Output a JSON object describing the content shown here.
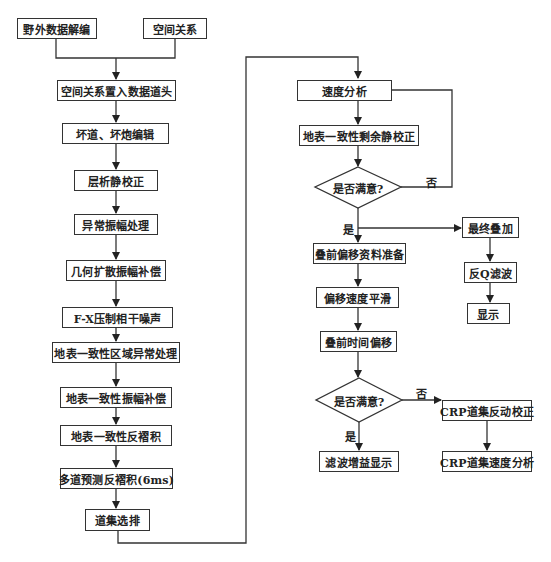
{
  "flowchart": {
    "left_column": [
      {
        "id": "field-data-decode",
        "label": "野外数据解编"
      },
      {
        "id": "spatial-relation",
        "label": "空间关系"
      },
      {
        "id": "spatial-to-header",
        "label": "空间关系置入数据道头"
      },
      {
        "id": "bad-trace-edit",
        "label": "坏道、坏炮编辑"
      },
      {
        "id": "tomo-statics",
        "label": "层析静校正"
      },
      {
        "id": "abnormal-amp",
        "label": "异常振幅处理"
      },
      {
        "id": "geo-spread-comp",
        "label": "几何扩散振幅补偿"
      },
      {
        "id": "fx-noise",
        "label": "F-X压制相干噪声"
      },
      {
        "id": "sc-regional-anomaly",
        "label": "地表一致性区域异常处理"
      },
      {
        "id": "sc-amp-comp",
        "label": "地表一致性振幅补偿"
      },
      {
        "id": "sc-decon",
        "label": "地表一致性反褶积"
      },
      {
        "id": "multi-trace-decon",
        "label": "多道预测反褶积(6ms)"
      },
      {
        "id": "gather-sort",
        "label": "道集选排"
      }
    ],
    "center_column": [
      {
        "id": "velocity-analysis",
        "label": "速度分析"
      },
      {
        "id": "sc-residual-statics",
        "label": "地表一致性剩余静校正"
      },
      {
        "id": "decision-1",
        "label": "是否满意?",
        "shape": "diamond"
      },
      {
        "id": "prestack-mig-prep",
        "label": "叠前偏移资料准备"
      },
      {
        "id": "mig-velocity-smooth",
        "label": "偏移速度平滑"
      },
      {
        "id": "prestack-time-mig",
        "label": "叠前时间偏移"
      },
      {
        "id": "decision-2",
        "label": "是否满意?",
        "shape": "diamond"
      },
      {
        "id": "filter-gain-display",
        "label": "滤波增益显示"
      }
    ],
    "right_column": [
      {
        "id": "final-stack",
        "label": "最终叠加"
      },
      {
        "id": "inverse-q",
        "label": "反Q滤波"
      },
      {
        "id": "display",
        "label": "显示"
      },
      {
        "id": "crp-nmo-reverse",
        "label": "CRP道集反动校正"
      },
      {
        "id": "crp-velocity",
        "label": "CRP道集速度分析"
      }
    ],
    "edge_labels": {
      "yes": "是",
      "no": "否"
    }
  }
}
